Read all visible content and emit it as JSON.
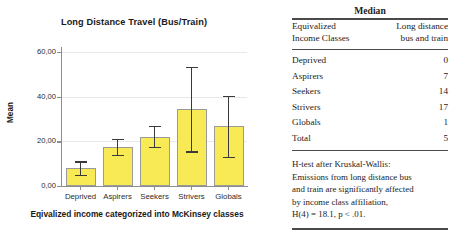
{
  "chart_data": {
    "type": "bar",
    "title": "Long Distance Travel (Bus/Train)",
    "xlabel": "Eqivalized income categorized into McKinsey classes",
    "ylabel": "Mean",
    "categories": [
      "Deprived",
      "Aspirers",
      "Seekers",
      "Strivers",
      "Globals"
    ],
    "values": [
      8.0,
      17.5,
      22.0,
      34.5,
      27.0
    ],
    "error_low": [
      5.0,
      14.0,
      17.5,
      15.5,
      13.0
    ],
    "error_high": [
      11.0,
      21.0,
      27.0,
      53.5,
      40.5
    ],
    "ylim": [
      0,
      60
    ],
    "yticks": [
      0,
      20,
      40,
      60
    ],
    "ytick_labels": [
      "0,00",
      "20,00",
      "40,00",
      "60,00"
    ],
    "grid": true,
    "legend": "none",
    "bar_color": "#f7ea55",
    "bar_border_color": "#9a9a9a",
    "error_color": "#3a3a3a"
  },
  "table": {
    "header": "Median",
    "columns": [
      {
        "line1": "Equivalized",
        "line2": "Income Classes"
      },
      {
        "line1": "Long distance",
        "line2": "bus and train"
      }
    ],
    "rows": [
      {
        "label": "Deprived",
        "value": "0"
      },
      {
        "label": "Aspirers",
        "value": "7"
      },
      {
        "label": "Seekers",
        "value": "14"
      },
      {
        "label": "Strivers",
        "value": "17"
      },
      {
        "label": "Globals",
        "value": "1"
      },
      {
        "label": "Total",
        "value": "5"
      }
    ],
    "footnote": [
      "H-test after Kruskal-Wallis:",
      "Emissions from long distance bus",
      "and train are significantly affected",
      "by income class affiliation,",
      "H(4) = 18.1, p < .01."
    ]
  }
}
